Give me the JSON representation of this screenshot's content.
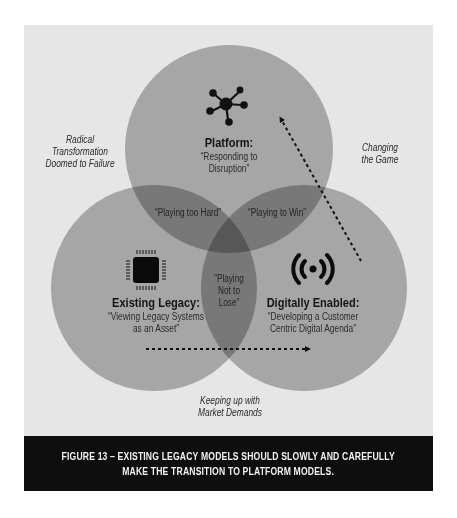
{
  "figure": {
    "caption_line1": "FIGURE 13 – EXISTING LEGACY MODELS SHOULD SLOWLY AND CAREFULLY",
    "caption_line2": "MAKE THE TRANSITION TO PLATFORM MODELS."
  },
  "circles": {
    "platform": {
      "title": "Platform:",
      "subtitle_line1": "“Responding to",
      "subtitle_line2": "Disruption”",
      "icon": "network-hub-icon"
    },
    "existing_legacy": {
      "title": "Existing Legacy:",
      "subtitle_line1": "“Viewing Legacy Systems",
      "subtitle_line2": "as an Asset”",
      "icon": "cpu-chip-icon"
    },
    "digitally_enabled": {
      "title": "Digitally Enabled:",
      "subtitle_line1": "“Developing a Customer",
      "subtitle_line2": "Centric Digital Agenda”",
      "icon": "broadcast-signal-icon"
    }
  },
  "overlaps": {
    "platform_legacy": "“Playing too Hard”",
    "platform_digital": "“Playing to Win”",
    "legacy_digital_line1": "“Playing",
    "legacy_digital_line2": "Not to",
    "legacy_digital_line3": "Lose”"
  },
  "annotations": {
    "radical_line1": "Radical",
    "radical_line2": "Transformation",
    "radical_line3": "Doomed to Failure",
    "changing_line1": "Changing",
    "changing_line2": "the Game",
    "keeping_line1": "Keeping up with",
    "keeping_line2": "Market Demands"
  },
  "colors": {
    "panel": "#e6e6e6",
    "circle": "#a9a9a9",
    "caption_band": "#0e0e0e",
    "caption_text": "#f2f2f2"
  }
}
